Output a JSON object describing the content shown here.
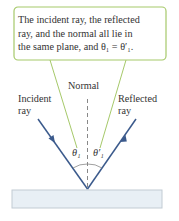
{
  "callout": {
    "line1": "The incident ray, the reflected",
    "line2": "ray, and the normal all lie in",
    "line3": "the same plane, and θ₁ = θ′₁."
  },
  "labels": {
    "normal": "Normal",
    "incident_1": "Incident",
    "incident_2": "ray",
    "reflected_1": "Reflected",
    "reflected_2": "ray",
    "theta1": "θ₁",
    "theta1_prime": "θ′₁"
  },
  "colors": {
    "callout_border": "#a6c96a",
    "ray": "#3b5a8c",
    "normal": "#888888",
    "surface_fill": "#e8eff5",
    "surface_border": "#c2cbd3",
    "text": "#333333"
  }
}
